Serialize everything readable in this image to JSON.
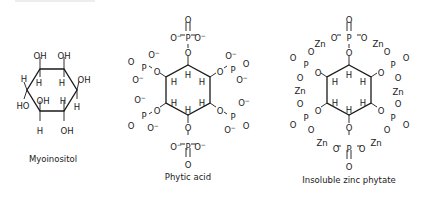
{
  "figure": {
    "background": "#ffffff",
    "ink_color": "#1a1a1a",
    "structures": [
      {
        "id": "myoinositol",
        "caption": "Myoinositol",
        "caption_pos": [
          53,
          162
        ],
        "ring": [
          [
            40,
            69
          ],
          [
            64,
            69
          ],
          [
            77,
            90
          ],
          [
            64,
            111
          ],
          [
            40,
            111
          ],
          [
            27,
            90
          ]
        ],
        "bonds": [
          [
            40,
            69,
            40,
            57
          ],
          [
            64,
            69,
            64,
            57
          ],
          [
            40,
            69,
            40,
            77
          ],
          [
            64,
            69,
            64,
            77
          ],
          [
            77,
            90,
            79,
            81
          ],
          [
            77,
            90,
            77,
            99
          ],
          [
            27,
            90,
            24,
            82
          ],
          [
            27,
            90,
            24,
            99
          ],
          [
            40,
            111,
            40,
            101
          ],
          [
            64,
            111,
            64,
            101
          ],
          [
            40,
            111,
            40,
            121
          ],
          [
            64,
            111,
            64,
            121
          ]
        ],
        "labels": [
          {
            "t": "OH",
            "x": 40,
            "y": 56
          },
          {
            "t": "OH",
            "x": 64,
            "y": 56
          },
          {
            "t": "H",
            "x": 39,
            "y": 83
          },
          {
            "t": "H",
            "x": 62,
            "y": 83
          },
          {
            "t": "H",
            "x": 24,
            "y": 79
          },
          {
            "t": "OH",
            "x": 84,
            "y": 80
          },
          {
            "t": "HO",
            "x": 23,
            "y": 106
          },
          {
            "t": "H",
            "x": 77,
            "y": 107
          },
          {
            "t": "OH",
            "x": 43,
            "y": 101
          },
          {
            "t": "H",
            "x": 63,
            "y": 101
          },
          {
            "t": "H",
            "x": 40,
            "y": 131
          },
          {
            "t": "OH",
            "x": 67,
            "y": 131
          }
        ]
      },
      {
        "id": "phytic-acid",
        "caption": "Phytic acid",
        "caption_pos": [
          188,
          180
        ],
        "ring": [
          [
            188,
            65
          ],
          [
            210,
            77
          ],
          [
            210,
            103
          ],
          [
            188,
            115
          ],
          [
            166,
            103
          ],
          [
            166,
            77
          ]
        ],
        "bonds": [
          [
            188,
            65,
            188,
            56
          ],
          [
            188,
            48,
            188,
            44
          ],
          [
            180,
            35,
            185,
            35
          ],
          [
            191,
            35,
            196,
            35
          ],
          [
            186,
            22,
            186,
            31
          ],
          [
            190,
            22,
            190,
            31
          ],
          [
            210,
            77,
            216,
            73
          ],
          [
            224,
            68,
            227,
            66
          ],
          [
            166,
            77,
            160,
            73
          ],
          [
            152,
            68,
            149,
            66
          ],
          [
            210,
            103,
            216,
            107
          ],
          [
            224,
            112,
            227,
            114
          ],
          [
            166,
            103,
            160,
            107
          ],
          [
            152,
            112,
            149,
            114
          ],
          [
            188,
            115,
            188,
            123
          ],
          [
            188,
            131,
            188,
            135
          ],
          [
            180,
            144,
            185,
            144
          ],
          [
            191,
            144,
            196,
            144
          ],
          [
            186,
            148,
            186,
            157
          ],
          [
            190,
            148,
            190,
            157
          ]
        ],
        "labels": [
          {
            "t": "O",
            "x": 188,
            "y": 20
          },
          {
            "t": "O",
            "x": 176,
            "y": 38,
            "sup": "−"
          },
          {
            "t": "P",
            "x": 188,
            "y": 38
          },
          {
            "t": "O",
            "x": 200,
            "y": 38,
            "sup": "−"
          },
          {
            "t": "O",
            "x": 188,
            "y": 53
          },
          {
            "t": "H",
            "x": 188,
            "y": 75
          },
          {
            "t": "H",
            "x": 202,
            "y": 82
          },
          {
            "t": "H",
            "x": 174,
            "y": 82
          },
          {
            "t": "H",
            "x": 174,
            "y": 103
          },
          {
            "t": "H",
            "x": 202,
            "y": 103
          },
          {
            "t": "H",
            "x": 188,
            "y": 110
          },
          {
            "t": "O",
            "x": 220,
            "y": 72
          },
          {
            "t": "P",
            "x": 233,
            "y": 70
          },
          {
            "t": "O",
            "x": 231,
            "y": 56,
            "sup": "−"
          },
          {
            "t": "O",
            "x": 246,
            "y": 64
          },
          {
            "t": "O",
            "x": 242,
            "y": 80,
            "sup": "−"
          },
          {
            "t": "O",
            "x": 157,
            "y": 72
          },
          {
            "t": "P",
            "x": 144,
            "y": 68
          },
          {
            "t": "O",
            "x": 154,
            "y": 55,
            "sup": "−"
          },
          {
            "t": "O",
            "x": 131,
            "y": 62
          },
          {
            "t": "O",
            "x": 138,
            "y": 80,
            "sup": "−"
          },
          {
            "t": "O",
            "x": 220,
            "y": 111
          },
          {
            "t": "P",
            "x": 233,
            "y": 117
          },
          {
            "t": "O",
            "x": 244,
            "y": 103,
            "sup": "−"
          },
          {
            "t": "O",
            "x": 246,
            "y": 126
          },
          {
            "t": "O",
            "x": 230,
            "y": 130,
            "sup": "−"
          },
          {
            "t": "O",
            "x": 157,
            "y": 111
          },
          {
            "t": "P",
            "x": 144,
            "y": 116
          },
          {
            "t": "O",
            "x": 140,
            "y": 100,
            "sup": "−"
          },
          {
            "t": "O",
            "x": 131,
            "y": 126
          },
          {
            "t": "O",
            "x": 153,
            "y": 128,
            "sup": "−"
          },
          {
            "t": "O",
            "x": 188,
            "y": 128
          },
          {
            "t": "O",
            "x": 176,
            "y": 147,
            "sup": "−"
          },
          {
            "t": "P",
            "x": 188,
            "y": 147
          },
          {
            "t": "O",
            "x": 200,
            "y": 147,
            "sup": "−"
          },
          {
            "t": "O",
            "x": 188,
            "y": 165
          }
        ]
      },
      {
        "id": "zinc-phytate",
        "caption": "Insoluble zinc phytate",
        "caption_pos": [
          349,
          183
        ],
        "ring": [
          [
            349,
            65
          ],
          [
            371,
            77
          ],
          [
            371,
            103
          ],
          [
            349,
            115
          ],
          [
            327,
            103
          ],
          [
            327,
            77
          ]
        ],
        "bonds": [
          [
            349,
            65,
            349,
            56
          ],
          [
            349,
            48,
            349,
            44
          ],
          [
            347,
            22,
            347,
            31
          ],
          [
            351,
            22,
            351,
            31
          ],
          [
            347,
            150,
            347,
            159
          ],
          [
            351,
            150,
            351,
            159
          ],
          [
            349,
            115,
            349,
            123
          ],
          [
            349,
            131,
            349,
            135
          ],
          [
            371,
            77,
            377,
            73
          ],
          [
            327,
            77,
            321,
            73
          ],
          [
            371,
            103,
            377,
            107
          ],
          [
            327,
            103,
            321,
            107
          ],
          [
            337,
            35,
            341,
            35
          ],
          [
            357,
            35,
            361,
            35
          ],
          [
            337,
            146,
            341,
            146
          ],
          [
            357,
            146,
            361,
            146
          ]
        ],
        "labels": [
          {
            "t": "O",
            "x": 349,
            "y": 20
          },
          {
            "t": "P",
            "x": 349,
            "y": 38
          },
          {
            "t": "O",
            "x": 334,
            "y": 38
          },
          {
            "t": "O",
            "x": 364,
            "y": 38
          },
          {
            "t": "Zn",
            "x": 320,
            "y": 44
          },
          {
            "t": "Zn",
            "x": 378,
            "y": 44
          },
          {
            "t": "O",
            "x": 311,
            "y": 52
          },
          {
            "t": "O",
            "x": 387,
            "y": 52
          },
          {
            "t": "O",
            "x": 349,
            "y": 53
          },
          {
            "t": "P",
            "x": 306,
            "y": 65
          },
          {
            "t": "O",
            "x": 293,
            "y": 58
          },
          {
            "t": "O",
            "x": 318,
            "y": 73
          },
          {
            "t": "P",
            "x": 393,
            "y": 65
          },
          {
            "t": "O",
            "x": 406,
            "y": 58
          },
          {
            "t": "O",
            "x": 381,
            "y": 73
          },
          {
            "t": "O",
            "x": 300,
            "y": 78
          },
          {
            "t": "O",
            "x": 398,
            "y": 78
          },
          {
            "t": "Zn",
            "x": 300,
            "y": 91
          },
          {
            "t": "Zn",
            "x": 398,
            "y": 92
          },
          {
            "t": "O",
            "x": 300,
            "y": 104
          },
          {
            "t": "O",
            "x": 398,
            "y": 104
          },
          {
            "t": "H",
            "x": 349,
            "y": 75
          },
          {
            "t": "H",
            "x": 363,
            "y": 82
          },
          {
            "t": "H",
            "x": 335,
            "y": 82
          },
          {
            "t": "H",
            "x": 335,
            "y": 103
          },
          {
            "t": "H",
            "x": 363,
            "y": 103
          },
          {
            "t": "H",
            "x": 349,
            "y": 110
          },
          {
            "t": "O",
            "x": 318,
            "y": 111
          },
          {
            "t": "P",
            "x": 306,
            "y": 118
          },
          {
            "t": "O",
            "x": 293,
            "y": 125
          },
          {
            "t": "O",
            "x": 311,
            "y": 130
          },
          {
            "t": "O",
            "x": 381,
            "y": 111
          },
          {
            "t": "P",
            "x": 393,
            "y": 118
          },
          {
            "t": "O",
            "x": 406,
            "y": 125
          },
          {
            "t": "O",
            "x": 387,
            "y": 130
          },
          {
            "t": "Zn",
            "x": 322,
            "y": 143
          },
          {
            "t": "Zn",
            "x": 376,
            "y": 143
          },
          {
            "t": "O",
            "x": 349,
            "y": 128
          },
          {
            "t": "O",
            "x": 336,
            "y": 149
          },
          {
            "t": "P",
            "x": 349,
            "y": 149
          },
          {
            "t": "O",
            "x": 362,
            "y": 149
          },
          {
            "t": "O",
            "x": 349,
            "y": 167
          }
        ]
      }
    ]
  }
}
